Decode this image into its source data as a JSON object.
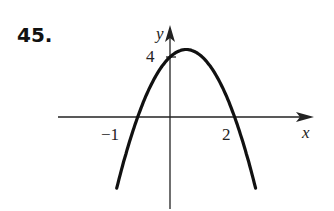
{
  "problem_number": "45.",
  "chart_data": {
    "type": "line",
    "title": "",
    "xlabel": "x",
    "ylabel": "y",
    "function": "y = -2x^2 + 2x + 4",
    "x_intercepts": [
      -1,
      2
    ],
    "y_intercept": 4,
    "vertex": [
      0.5,
      4.5
    ],
    "tick_labels": {
      "x": [
        "-1",
        "2"
      ],
      "y": [
        "4"
      ]
    },
    "x": [
      -1.8,
      -1.5,
      -1,
      -0.5,
      0,
      0.5,
      1,
      1.5,
      2,
      2.5,
      2.8
    ],
    "values": [
      -6.08,
      -3.5,
      0,
      2.5,
      4,
      4.5,
      4,
      2.5,
      0,
      -3.5,
      -6.08
    ],
    "grid": false
  },
  "labels": {
    "x_axis": "x",
    "y_axis": "y",
    "x_tick_neg1": "−1",
    "x_tick_2": "2",
    "y_tick_4": "4"
  }
}
